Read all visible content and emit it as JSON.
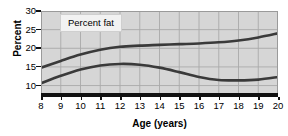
{
  "chart_data": {
    "type": "line",
    "title": "",
    "xlabel": "Age (years)",
    "ylabel": "Percent",
    "xlim": [
      8,
      20
    ],
    "ylim": [
      8,
      30
    ],
    "grid": true,
    "legend_position": "top-left-inside",
    "legend_label": "Percent fat",
    "xticks": [
      "8",
      "9",
      "10",
      "11",
      "12",
      "13",
      "14",
      "15",
      "16",
      "17",
      "18",
      "19",
      "20"
    ],
    "yticks": [
      "10",
      "15",
      "20",
      "25",
      "30"
    ],
    "x": [
      8,
      9,
      10,
      11,
      12,
      13,
      14,
      15,
      16,
      17,
      18,
      19,
      20
    ],
    "series": [
      {
        "name": "upper-curve",
        "color": "#3a3a3a",
        "values": [
          14.8,
          16.6,
          18.3,
          19.6,
          20.4,
          20.7,
          20.9,
          21.1,
          21.3,
          21.6,
          22.1,
          22.9,
          24.0
        ]
      },
      {
        "name": "lower-curve",
        "color": "#3a3a3a",
        "values": [
          10.6,
          12.6,
          14.3,
          15.4,
          15.8,
          15.6,
          14.8,
          13.6,
          12.3,
          11.5,
          11.4,
          11.6,
          12.3
        ]
      }
    ]
  },
  "axis": {
    "ylabel": "Percent",
    "xlabel": "Age (years)"
  },
  "legend": {
    "label": "Percent fat"
  }
}
